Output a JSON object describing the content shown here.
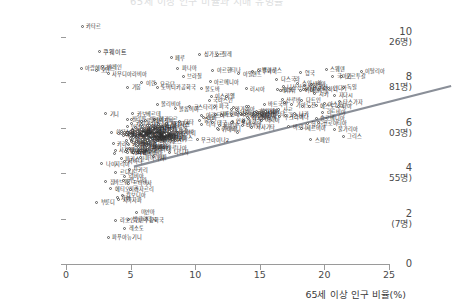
{
  "title_faint": "65세 이상 인구 비율과 치매 유병률",
  "axes": {
    "x": {
      "label": "65세 이상 인구 비율(%)",
      "ticks": [
        "0",
        "5",
        "10",
        "15",
        "20",
        "25"
      ],
      "values": [
        0,
        5,
        10,
        15,
        20,
        25
      ],
      "min": 0,
      "max": 25
    },
    "y": {
      "label": "",
      "ticks": [
        {
          "num": "10",
          "sub": "(2만 2,026명)",
          "value": 10
        },
        {
          "num": "8",
          "sub": "(2,981명)",
          "value": 8
        },
        {
          "num": "6",
          "sub": "(403명)",
          "value": 6
        },
        {
          "num": "4",
          "sub": "(55명)",
          "value": 4
        },
        {
          "num": "2",
          "sub": "(7명)",
          "value": 2
        },
        {
          "num": "0",
          "sub": "",
          "value": 0
        }
      ],
      "min": 0,
      "max": 11
    }
  },
  "colors": {
    "point_stroke": "#5a5a5a",
    "point_fill": "#ffffff",
    "trend_line": "#8a8f98",
    "axis": "#9a9a9a",
    "grid": "#f0f0f0",
    "text": "#2e2e2e"
  },
  "trend": {
    "x_start": 0.15,
    "y_start": 4.9,
    "x_end": 24.7,
    "y_end": 8.45,
    "width_px": 2.2
  },
  "chart_data": {
    "type": "scatter",
    "title": "65세 이상 인구 비율과 치매 유병률",
    "xlabel": "65세 이상 인구 비율(%)",
    "ylabel": "",
    "xlim": [
      0,
      25
    ],
    "ylim": [
      0,
      11
    ],
    "grid": true,
    "legend": "none",
    "trendline": {
      "slope": 0.144,
      "intercept": 4.88
    },
    "points": [
      {
        "label": "카타르",
        "x": 1.3,
        "y": 10.45,
        "lp": "r"
      },
      {
        "label": "쿠웨이트",
        "x": 2.6,
        "y": 9.35,
        "lp": "r",
        "big": true
      },
      {
        "label": "아랍에미리트",
        "x": 1.2,
        "y": 8.6,
        "lp": "r"
      },
      {
        "label": "바레인",
        "x": 2.9,
        "y": 8.65,
        "lp": "r"
      },
      {
        "label": "오만",
        "x": 2.4,
        "y": 8.5,
        "lp": "r"
      },
      {
        "label": "사우디아라비아",
        "x": 3.3,
        "y": 8.35,
        "lp": "r"
      },
      {
        "label": "페루",
        "x": 8.2,
        "y": 9.05,
        "lp": "r"
      },
      {
        "label": "싱가포르",
        "x": 10.4,
        "y": 9.2,
        "lp": "r"
      },
      {
        "label": "칠레",
        "x": 11.8,
        "y": 9.2,
        "lp": "r"
      },
      {
        "label": "파나마",
        "x": 8.7,
        "y": 8.6,
        "lp": "r"
      },
      {
        "label": "브라질",
        "x": 9.1,
        "y": 8.25,
        "lp": "r"
      },
      {
        "label": "아르헨티나",
        "x": 11.4,
        "y": 8.5,
        "lp": "r"
      },
      {
        "label": "우루과이",
        "x": 14.5,
        "y": 8.45,
        "lp": "r"
      },
      {
        "label": "벨라루스",
        "x": 14.9,
        "y": 8.5,
        "lp": "r"
      },
      {
        "label": "스웨덴",
        "x": 20.2,
        "y": 8.55,
        "lp": "r"
      },
      {
        "label": "이탈리아",
        "x": 22.9,
        "y": 8.45,
        "lp": "r"
      },
      {
        "label": "포르투갈",
        "x": 21.4,
        "y": 8.25,
        "lp": "r"
      },
      {
        "label": "아일랜드",
        "x": 13.4,
        "y": 8.35,
        "lp": "r"
      },
      {
        "label": "영국",
        "x": 18.2,
        "y": 8.4,
        "lp": "r"
      },
      {
        "label": "가봉",
        "x": 4.8,
        "y": 7.75,
        "lp": "r"
      },
      {
        "label": "이란",
        "x": 5.9,
        "y": 7.95,
        "lp": "r"
      },
      {
        "label": "요르단",
        "x": 7.0,
        "y": 7.9,
        "lp": "r"
      },
      {
        "label": "도미니카공화국",
        "x": 7.1,
        "y": 7.75,
        "lp": "r"
      },
      {
        "label": "아르메니아",
        "x": 11.2,
        "y": 8.0,
        "lp": "r"
      },
      {
        "label": "몰도바",
        "x": 10.5,
        "y": 7.7,
        "lp": "r"
      },
      {
        "label": "러시아",
        "x": 14.0,
        "y": 7.7,
        "lp": "r"
      },
      {
        "label": "캐나다",
        "x": 16.4,
        "y": 7.65,
        "lp": "r"
      },
      {
        "label": "네덜란드",
        "x": 18.6,
        "y": 7.65,
        "lp": "r"
      },
      {
        "label": "독일",
        "x": 21.5,
        "y": 7.75,
        "lp": "r"
      },
      {
        "label": "이스라엘",
        "x": 11.3,
        "y": 7.35,
        "lp": "r"
      },
      {
        "label": "볼리비아",
        "x": 7.1,
        "y": 7.0,
        "lp": "r"
      },
      {
        "label": "코스타리카",
        "x": 9.6,
        "y": 6.9,
        "lp": "r"
      },
      {
        "label": "에스토니아",
        "x": 19.4,
        "y": 6.95,
        "lp": "r"
      },
      {
        "label": "콜롬비아",
        "x": 8.5,
        "y": 6.8,
        "lp": "r"
      },
      {
        "label": "기니",
        "x": 3.1,
        "y": 6.6,
        "lp": "r"
      },
      {
        "label": "카보베르데",
        "x": 5.2,
        "y": 6.6,
        "lp": "r"
      },
      {
        "label": "라트비아",
        "x": 19.9,
        "y": 6.65,
        "lp": "r"
      },
      {
        "label": "우크라이나",
        "x": 16.6,
        "y": 6.45,
        "lp": "r"
      },
      {
        "label": "슬로베니아",
        "x": 19.4,
        "y": 6.4,
        "lp": "r"
      },
      {
        "label": "헝가리",
        "x": 18.7,
        "y": 6.15,
        "lp": "r"
      },
      {
        "label": "불가리아",
        "x": 20.8,
        "y": 5.9,
        "lp": "r"
      },
      {
        "label": "그리스",
        "x": 21.5,
        "y": 5.6,
        "lp": "r"
      },
      {
        "label": "세르비아",
        "x": 18.3,
        "y": 5.95,
        "lp": "r"
      },
      {
        "label": "크로아티아",
        "x": 19.6,
        "y": 6.2,
        "lp": "r"
      },
      {
        "label": "필리핀",
        "x": 4.8,
        "y": 6.35,
        "lp": "r"
      },
      {
        "label": "에콰도르",
        "x": 6.9,
        "y": 6.35,
        "lp": "r"
      },
      {
        "label": "말레이시아",
        "x": 6.2,
        "y": 6.3,
        "lp": "r"
      },
      {
        "label": "중국",
        "x": 10.4,
        "y": 6.3,
        "lp": "r"
      },
      {
        "label": "태국",
        "x": 11.4,
        "y": 6.2,
        "lp": "r"
      },
      {
        "label": "베트남",
        "x": 7.2,
        "y": 6.1,
        "lp": "r"
      },
      {
        "label": "멕시코",
        "x": 6.8,
        "y": 5.95,
        "lp": "r"
      },
      {
        "label": "모로코",
        "x": 6.5,
        "y": 5.65,
        "lp": "r"
      },
      {
        "label": "인도네시아",
        "x": 5.3,
        "y": 5.6,
        "lp": "r"
      },
      {
        "label": "터키",
        "x": 8.1,
        "y": 5.5,
        "lp": "r"
      },
      {
        "label": "이집트",
        "x": 5.1,
        "y": 5.4,
        "lp": "r"
      },
      {
        "label": "우크라이나2",
        "x": 10.2,
        "y": 5.45,
        "lp": "r"
      },
      {
        "label": "스페인",
        "x": 19.0,
        "y": 5.45,
        "lp": "r"
      },
      {
        "label": "일본",
        "x": 26.0,
        "y": 3.3,
        "lp": "r"
      },
      {
        "label": "인도",
        "x": 5.6,
        "y": 4.9,
        "lp": "r"
      },
      {
        "label": "파키스탄",
        "x": 4.3,
        "y": 4.6,
        "lp": "r"
      },
      {
        "label": "나이지리아",
        "x": 2.8,
        "y": 4.4,
        "lp": "r"
      },
      {
        "label": "리비아",
        "x": 4.6,
        "y": 3.85,
        "lp": "r"
      },
      {
        "label": "짐바브웨",
        "x": 3.1,
        "y": 3.6,
        "lp": "r"
      },
      {
        "label": "에티오피아",
        "x": 3.5,
        "y": 3.3,
        "lp": "r"
      },
      {
        "label": "캄보디아",
        "x": 4.4,
        "y": 3.0,
        "lp": "r"
      },
      {
        "label": "부룬디",
        "x": 2.4,
        "y": 2.7,
        "lp": "r"
      },
      {
        "label": "미얀마",
        "x": 5.5,
        "y": 2.25,
        "lp": "r"
      },
      {
        "label": "방글라데시",
        "x": 4.9,
        "y": 1.95,
        "lp": "r"
      },
      {
        "label": "라오인민민주공화국",
        "x": 3.9,
        "y": 1.9,
        "lp": "r"
      },
      {
        "label": "레소토",
        "x": 4.6,
        "y": 1.55,
        "lp": "r"
      },
      {
        "label": "파푸아뉴기니",
        "x": 3.3,
        "y": 1.15,
        "lp": "r"
      }
    ],
    "cluster_noise_count": 210
  }
}
